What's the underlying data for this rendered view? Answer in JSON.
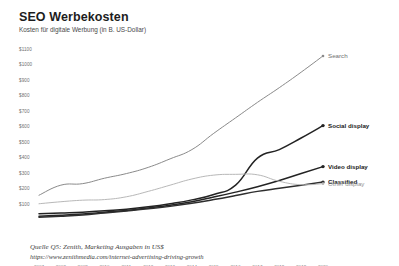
{
  "header": {
    "title": "SEO Werbekosten",
    "subtitle": "Kosten für digitale Werbung (in B. US-Dollar)"
  },
  "footer": {
    "source": "Quelle Q5: Zenith, Marketing Ausgaben in US$",
    "url": "https://www.zenithmedia.com/internet-advertising-driving-growth"
  },
  "chart_data": {
    "type": "line",
    "title": "SEO Werbekosten",
    "subtitle": "Kosten für digitale Werbung (in B. US-Dollar)",
    "xlabel": "",
    "ylabel": "",
    "x": [
      2007,
      2008,
      2009,
      2010,
      2011,
      2012,
      2013,
      2014,
      2015,
      2016,
      2017,
      2018,
      2019,
      2020
    ],
    "xtick_labels": [
      "2007",
      "2008",
      "2009",
      "2010",
      "2011",
      "2012",
      "2013",
      "2014",
      "2015",
      "2016",
      "2017",
      "2018",
      "2019",
      "2020"
    ],
    "ytick_labels": [
      "$1100",
      "$1000",
      "$900",
      "$800",
      "$700",
      "$600",
      "$500",
      "$400",
      "$300",
      "$200",
      "$100"
    ],
    "ytick_values": [
      1100,
      1000,
      900,
      800,
      700,
      600,
      500,
      400,
      300,
      200,
      100
    ],
    "ylim": [
      0,
      1150
    ],
    "grid": false,
    "legend_position": "right-inline",
    "series": [
      {
        "name": "Search",
        "color": "#8a8a8a",
        "label_style": "mid",
        "values": [
          160,
          225,
          235,
          270,
          300,
          340,
          395,
          455,
          560,
          660,
          760,
          855,
          955,
          1060
        ]
      },
      {
        "name": "Social display",
        "color": "#232323",
        "label_style": "bold",
        "values": [
          40,
          45,
          50,
          60,
          70,
          85,
          105,
          130,
          165,
          225,
          400,
          455,
          530,
          610
        ]
      },
      {
        "name": "Video display",
        "color": "#232323",
        "label_style": "bold",
        "values": [
          25,
          30,
          38,
          50,
          62,
          78,
          95,
          118,
          148,
          180,
          215,
          255,
          300,
          345
        ]
      },
      {
        "name": "Classified",
        "color": "#2e2e2e",
        "label_style": "bold",
        "values": [
          18,
          24,
          32,
          45,
          58,
          72,
          88,
          108,
          132,
          158,
          185,
          205,
          225,
          245
        ]
      },
      {
        "name": "Other display",
        "color": "#b8b8b8",
        "label_style": "light",
        "values": [
          105,
          118,
          128,
          132,
          150,
          185,
          225,
          265,
          290,
          295,
          292,
          250,
          228,
          235
        ]
      }
    ]
  }
}
